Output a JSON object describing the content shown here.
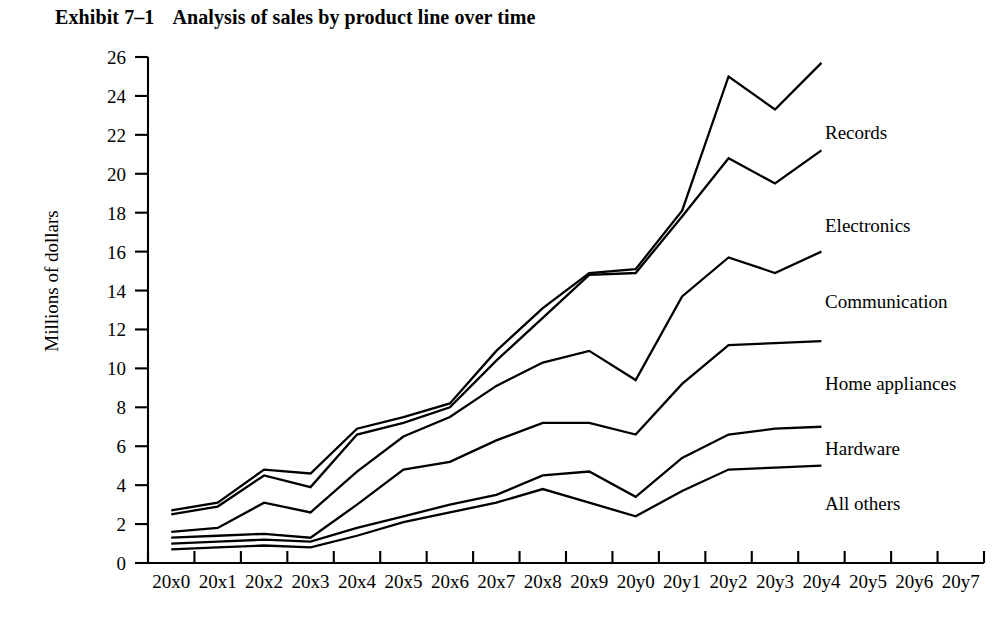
{
  "chart_data": {
    "type": "line",
    "title_number": "Exhibit 7–1",
    "title_text": "Analysis of sales by product line over time",
    "xlabel": "",
    "ylabel": "Millions of dollars",
    "ylim": [
      0,
      26
    ],
    "ytick_step": 2,
    "grid": false,
    "legend_position": "right-inline",
    "line_color": "#000000",
    "background_color": "#ffffff",
    "yticks": [
      0,
      2,
      4,
      6,
      8,
      10,
      12,
      14,
      16,
      18,
      20,
      22,
      24,
      26
    ],
    "categories": [
      "20x0",
      "20x1",
      "20x2",
      "20x3",
      "20x4",
      "20x5",
      "20x6",
      "20x7",
      "20x8",
      "20x9",
      "20y0",
      "20y1",
      "20y2",
      "20y3",
      "20y4",
      "20y5",
      "20y6",
      "20y7"
    ],
    "note": "Cumulative stacked-style sales curves; data plotted only through 20y4",
    "series": [
      {
        "name": "Records",
        "x": [
          "20x0",
          "20x1",
          "20x2",
          "20x3",
          "20x4",
          "20x5",
          "20x6",
          "20x7",
          "20x8",
          "20x9",
          "20y0",
          "20y1",
          "20y2",
          "20y3",
          "20y4"
        ],
        "values": [
          2.7,
          3.1,
          4.8,
          4.6,
          6.9,
          7.5,
          8.2,
          10.9,
          13.1,
          14.9,
          15.1,
          18.1,
          25.0,
          23.3,
          25.7
        ]
      },
      {
        "name": "Electronics",
        "x": [
          "20x0",
          "20x1",
          "20x2",
          "20x3",
          "20x4",
          "20x5",
          "20x6",
          "20x7",
          "20x8",
          "20x9",
          "20y0",
          "20y1",
          "20y2",
          "20y3",
          "20y4"
        ],
        "values": [
          2.5,
          2.9,
          4.5,
          3.9,
          6.6,
          7.2,
          8.0,
          10.4,
          12.6,
          14.8,
          14.9,
          17.8,
          20.8,
          19.5,
          21.2
        ]
      },
      {
        "name": "Communication",
        "x": [
          "20x0",
          "20x1",
          "20x2",
          "20x3",
          "20x4",
          "20x5",
          "20x6",
          "20x7",
          "20x8",
          "20x9",
          "20y0",
          "20y1",
          "20y2",
          "20y3",
          "20y4"
        ],
        "values": [
          1.6,
          1.8,
          3.1,
          2.6,
          4.7,
          6.5,
          7.5,
          9.1,
          10.3,
          10.9,
          9.4,
          13.7,
          15.7,
          14.9,
          16.0
        ]
      },
      {
        "name": "Home appliances",
        "x": [
          "20x0",
          "20x1",
          "20x2",
          "20x3",
          "20x4",
          "20x5",
          "20x6",
          "20x7",
          "20x8",
          "20x9",
          "20y0",
          "20y1",
          "20y2",
          "20y3",
          "20y4"
        ],
        "values": [
          1.3,
          1.4,
          1.5,
          1.3,
          3.0,
          4.8,
          5.2,
          6.3,
          7.2,
          7.2,
          6.6,
          9.2,
          11.2,
          11.3,
          11.4
        ]
      },
      {
        "name": "Hardware",
        "x": [
          "20x0",
          "20x1",
          "20x2",
          "20x3",
          "20x4",
          "20x5",
          "20x6",
          "20x7",
          "20x8",
          "20x9",
          "20y0",
          "20y1",
          "20y2",
          "20y3",
          "20y4"
        ],
        "values": [
          1.0,
          1.1,
          1.2,
          1.1,
          1.8,
          2.4,
          3.0,
          3.5,
          4.5,
          4.7,
          3.4,
          5.4,
          6.6,
          6.9,
          7.0
        ]
      },
      {
        "name": "All others",
        "x": [
          "20x0",
          "20x1",
          "20x2",
          "20x3",
          "20x4",
          "20x5",
          "20x6",
          "20x7",
          "20x8",
          "20x9",
          "20y0",
          "20y1",
          "20y2",
          "20y3",
          "20y4"
        ],
        "values": [
          0.7,
          0.8,
          0.9,
          0.8,
          1.4,
          2.1,
          2.6,
          3.1,
          3.8,
          3.1,
          2.4,
          3.7,
          4.8,
          4.9,
          5.0
        ]
      }
    ],
    "series_label_positions": [
      {
        "name": "Records",
        "x": 825,
        "y": 139
      },
      {
        "name": "Electronics",
        "x": 825,
        "y": 232
      },
      {
        "name": "Communication",
        "x": 825,
        "y": 308
      },
      {
        "name": "Home appliances",
        "x": 825,
        "y": 390
      },
      {
        "name": "Hardware",
        "x": 825,
        "y": 455
      },
      {
        "name": "All others",
        "x": 825,
        "y": 510
      }
    ]
  }
}
